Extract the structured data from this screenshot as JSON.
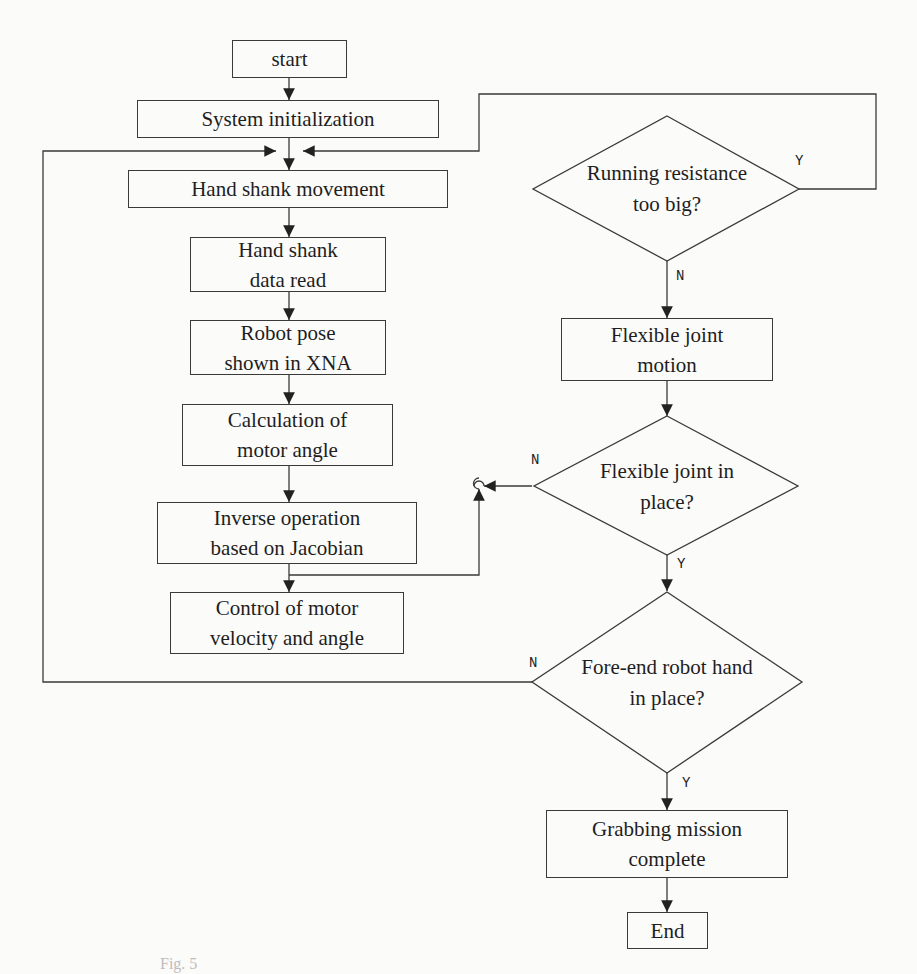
{
  "diagram": {
    "type": "flowchart",
    "nodes": {
      "start": "start",
      "init": "System initialization",
      "movement": "Hand shank movement",
      "read": "Hand shank\ndata read",
      "pose": "Robot pose\nshown in XNA",
      "calc": "Calculation of\nmotor angle",
      "inverse": "Inverse operation\nbased on Jacobian",
      "control": "Control of motor\nvelocity and angle",
      "resistance": "Running resistance\ntoo big?",
      "flex_motion": "Flexible joint\nmotion",
      "flex_place": "Flexible joint in\nplace?",
      "foreend": "Fore-end robot hand\nin place?",
      "grab": "Grabbing mission\ncomplete",
      "end": "End"
    },
    "edge_labels": {
      "resistance_yes": "Y",
      "resistance_no": "N",
      "flex_place_no": "N",
      "flex_place_yes": "Y",
      "foreend_no": "N",
      "foreend_yes": "Y"
    },
    "edges": [
      {
        "from": "start",
        "to": "init"
      },
      {
        "from": "init",
        "to": "movement"
      },
      {
        "from": "movement",
        "to": "read"
      },
      {
        "from": "read",
        "to": "pose"
      },
      {
        "from": "pose",
        "to": "calc"
      },
      {
        "from": "calc",
        "to": "inverse"
      },
      {
        "from": "inverse",
        "to": "control"
      },
      {
        "from": "inverse",
        "to": "resistance"
      },
      {
        "from": "resistance",
        "to": "movement",
        "label": "Y"
      },
      {
        "from": "resistance",
        "to": "flex_motion",
        "label": "N"
      },
      {
        "from": "flex_motion",
        "to": "flex_place"
      },
      {
        "from": "flex_place",
        "to": "inverse",
        "label": "N"
      },
      {
        "from": "flex_place",
        "to": "foreend",
        "label": "Y"
      },
      {
        "from": "foreend",
        "to": "movement",
        "label": "N"
      },
      {
        "from": "foreend",
        "to": "grab",
        "label": "Y"
      },
      {
        "from": "grab",
        "to": "end"
      }
    ],
    "caption": "Fig. 5"
  }
}
